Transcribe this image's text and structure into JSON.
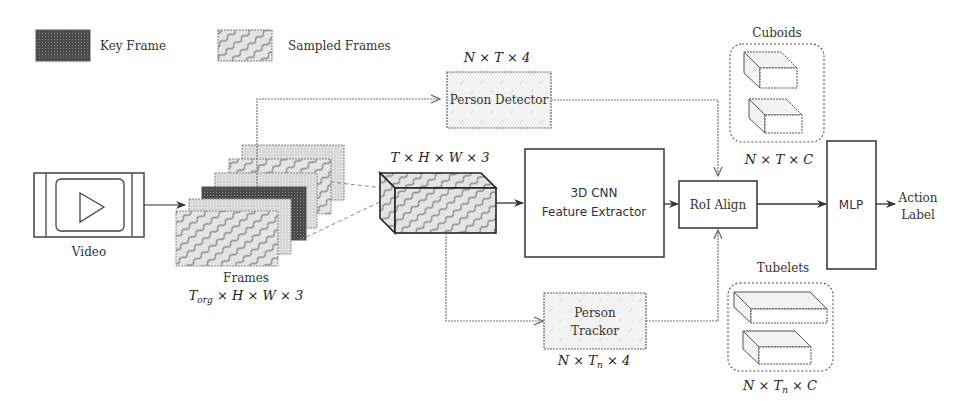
{
  "legend": {
    "key_frame": "Key Frame",
    "sampled_frames": "Sampled Frames"
  },
  "nodes": {
    "video": {
      "label": "Video"
    },
    "frames": {
      "label": "Frames",
      "shape": "T_org × H × W × 3"
    },
    "clip": {
      "shape": "T × H × W × 3"
    },
    "person_detector": {
      "label": "Person Detector",
      "shape": "N × T × 4"
    },
    "cnn": {
      "line1": "3D CNN",
      "line2": "Feature Extractor"
    },
    "person_tracker": {
      "line1": "Person",
      "line2": "Trackor",
      "shape": "N × Tn × 4"
    },
    "roi_align": {
      "label": "RoI Align"
    },
    "cuboids": {
      "label": "Cuboids",
      "shape": "N × T × C"
    },
    "tubelets": {
      "label": "Tubelets",
      "shape": "N × Tn × C"
    },
    "mlp": {
      "label": "MLP"
    },
    "output": {
      "line1": "Action",
      "line2": "Label"
    }
  },
  "colors": {
    "stroke": "#333333",
    "key_frame_fill": "#555555",
    "sampled_fill": "#e6e6e6",
    "light_frame_fill": "#dcdcdc"
  }
}
